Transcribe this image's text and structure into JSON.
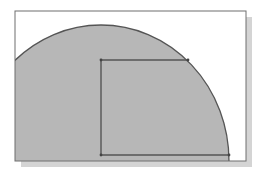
{
  "diagram": {
    "type": "cad-sketch",
    "colors": {
      "background": "#ffffff",
      "frame_stroke": "#6e6e6e",
      "shadow": "#d4d4d4",
      "fill": "#b7b7b7",
      "outline": "#555555"
    },
    "frame": {
      "x": 15,
      "y": 11,
      "width": 231,
      "height": 150
    },
    "arc": {
      "cx": 101,
      "cy": 161,
      "rx": 128,
      "ry": 136
    },
    "rectangle": {
      "x": 101,
      "y": 60,
      "width": 127,
      "height": 95
    }
  }
}
